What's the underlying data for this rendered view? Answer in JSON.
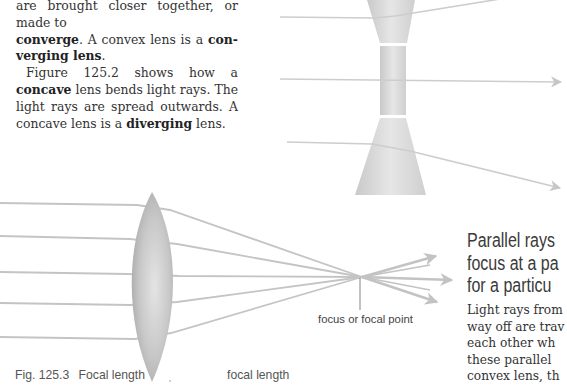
{
  "text_top_left": {
    "line_partial": "are brought closer together, or made to",
    "seg1_bold": "converge",
    "seg2": ". A convex lens is a ",
    "seg3_bold": "con-verging lens",
    "seg4": ".",
    "p2_a": "Figure 125.2 shows how a ",
    "p2_b_bold": "concave",
    "p2_c": " lens bends light rays. The light rays are spread outwards. A concave lens is a ",
    "p2_d_bold": "diverging",
    "p2_e": " lens."
  },
  "figure_concave": {
    "description": "concave lens diverging three parallel rays",
    "lens_color": "#d9d9d9",
    "ray_color": "#c8c8c8"
  },
  "figure_convex": {
    "description": "convex lens converging five parallel rays to focus",
    "lens_color": "#cfcfcf",
    "ray_color": "#c4c4c4",
    "focus_label": "focus or focal point",
    "caption_number": "Fig. 125.3",
    "caption_title": "Focal length",
    "focal_length_label": "focal length"
  },
  "side_heading": {
    "line1": "Parallel rays",
    "line2": "focus at a pa",
    "line3": "for a particu"
  },
  "side_body": {
    "line1": "Light rays from",
    "line2": "way off are trav",
    "line3": "each other wh",
    "line4": "these parallel",
    "line5": "convex lens, th"
  }
}
